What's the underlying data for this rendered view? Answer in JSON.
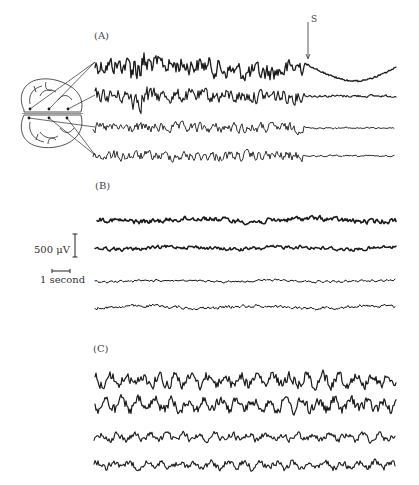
{
  "figure": {
    "panels": [
      {
        "id": "A",
        "label": "(A)",
        "label_pos": [
          94,
          30
        ],
        "stimulus_marker": {
          "label": "S",
          "x": 308,
          "y_top": 22,
          "y_bottom": 60
        },
        "traces": [
          {
            "y": 65,
            "x0": 95,
            "x1": 396,
            "amp_left": 9,
            "amp_right": 2,
            "width": 1.3,
            "slow_wave": true
          },
          {
            "y": 96,
            "x0": 95,
            "x1": 396,
            "amp_left": 7,
            "amp_right": 1.2,
            "width": 1.1,
            "slow_wave": false
          },
          {
            "y": 128,
            "x0": 93,
            "x1": 394,
            "amp_left": 5,
            "amp_right": 0.8,
            "width": 0.9,
            "slow_wave": false
          },
          {
            "y": 156,
            "x0": 93,
            "x1": 394,
            "amp_left": 5,
            "amp_right": 0.8,
            "width": 0.9,
            "slow_wave": false
          }
        ],
        "transition_x": 305
      },
      {
        "id": "B",
        "label": "(B)",
        "label_pos": [
          95,
          180
        ],
        "traces": [
          {
            "y": 220,
            "x0": 97,
            "x1": 396,
            "amp": 2.2,
            "width": 1.6
          },
          {
            "y": 248,
            "x0": 95,
            "x1": 396,
            "amp": 1.6,
            "width": 1.5
          },
          {
            "y": 281,
            "x0": 95,
            "x1": 395,
            "amp": 1.0,
            "width": 1.0
          },
          {
            "y": 307,
            "x0": 95,
            "x1": 395,
            "amp": 1.4,
            "width": 1.0
          }
        ]
      },
      {
        "id": "C",
        "label": "(C)",
        "label_pos": [
          93,
          343
        ],
        "traces": [
          {
            "y": 380,
            "x0": 95,
            "x1": 396,
            "amp": 8,
            "width": 1.2
          },
          {
            "y": 405,
            "x0": 95,
            "x1": 396,
            "amp": 8,
            "width": 1.2
          },
          {
            "y": 437,
            "x0": 94,
            "x1": 395,
            "amp": 5,
            "width": 1.1
          },
          {
            "y": 465,
            "x0": 94,
            "x1": 395,
            "amp": 5,
            "width": 1.1
          }
        ]
      }
    ],
    "scale_bars": {
      "voltage": {
        "label": "500 μV",
        "x": 75,
        "y_top": 234,
        "y_bottom": 257
      },
      "time": {
        "label": "1 second",
        "x0": 52,
        "x1": 70,
        "y": 271
      }
    },
    "brain_diagram": {
      "description": "Dorsal view of cortex hemispheres with electrode sites",
      "electrodes": [
        [
          30,
          109
        ],
        [
          49,
          109
        ],
        [
          68,
          109
        ],
        [
          29,
          118
        ],
        [
          49,
          118
        ],
        [
          67,
          118
        ]
      ]
    },
    "colors": {
      "ink": "#1a1a1a",
      "label": "#444444",
      "background": "#ffffff"
    }
  }
}
